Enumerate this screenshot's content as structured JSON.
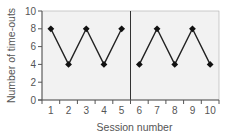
{
  "chart_data": {
    "type": "line",
    "title": "",
    "xlabel": "Session number",
    "ylabel": "Number of time-outs",
    "x": [
      1,
      2,
      3,
      4,
      5,
      6,
      7,
      8,
      9,
      10
    ],
    "x_tick_labels": [
      "1",
      "2",
      "3",
      "4",
      "5",
      "6",
      "7",
      "8",
      "9",
      "10"
    ],
    "y_ticks": [
      0,
      2,
      4,
      6,
      8,
      10
    ],
    "y_tick_labels": [
      "0",
      "2",
      "4",
      "6",
      "8",
      "10"
    ],
    "ylim": [
      0,
      10
    ],
    "xlim": [
      0.5,
      10.5
    ],
    "grid": false,
    "phase_divider_after_x": 5,
    "series": [
      {
        "name": "Phase A",
        "x": [
          1,
          2,
          3,
          4,
          5
        ],
        "values": [
          8,
          4,
          8,
          4,
          8
        ]
      },
      {
        "name": "Phase B",
        "x": [
          6,
          7,
          8,
          9,
          10
        ],
        "values": [
          4,
          8,
          4,
          8,
          4
        ]
      }
    ],
    "colors": {
      "plot_background": "#f2f2f2",
      "line": "#222222",
      "marker": "#111111",
      "axis": "#555555",
      "text": "#555555"
    }
  }
}
